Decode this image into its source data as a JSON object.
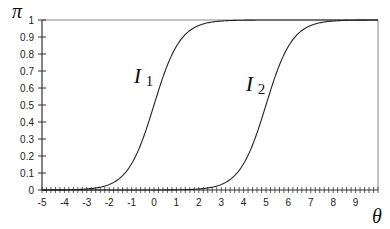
{
  "chart_data": {
    "type": "line",
    "title": "",
    "xlabel": "θ",
    "ylabel": "π",
    "xlim": [
      -5,
      10
    ],
    "ylim": [
      0,
      1
    ],
    "x_ticks": [
      -5,
      -4,
      -3,
      -2,
      -1,
      0,
      1,
      2,
      3,
      4,
      5,
      6,
      7,
      8,
      9
    ],
    "y_ticks": [
      0,
      0.1,
      0.2,
      0.3,
      0.4,
      0.5,
      0.6,
      0.7,
      0.8,
      0.9,
      1
    ],
    "x_minor_step": 0.2,
    "grid": false,
    "legend": null,
    "series": [
      {
        "name": "I1",
        "label_main": "I",
        "label_sub": "1",
        "model": "logistic",
        "location": 0,
        "slope": 1.7,
        "label_pos": [
          -0.9,
          0.63
        ]
      },
      {
        "name": "I2",
        "label_main": "I",
        "label_sub": "2",
        "model": "logistic",
        "location": 5,
        "slope": 1.7,
        "label_pos": [
          4.1,
          0.58
        ]
      }
    ],
    "sample_points": {
      "x": [
        -5,
        -4,
        -3,
        -2,
        -1,
        0,
        1,
        2,
        3,
        4,
        5,
        6,
        7,
        8,
        9,
        10
      ],
      "I1": [
        0.0002,
        0.001,
        0.006,
        0.032,
        0.154,
        0.5,
        0.846,
        0.968,
        0.994,
        0.999,
        1.0,
        1.0,
        1.0,
        1.0,
        1.0,
        1.0
      ],
      "I2": [
        0.0,
        0.0,
        0.0,
        0.0,
        0.0,
        0.0002,
        0.001,
        0.006,
        0.032,
        0.154,
        0.5,
        0.846,
        0.968,
        0.994,
        0.999,
        1.0
      ]
    }
  },
  "axes": {
    "x_label": "θ",
    "y_label": "π"
  }
}
